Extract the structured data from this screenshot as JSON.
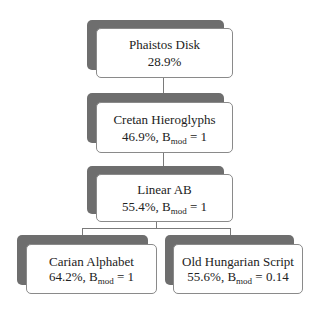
{
  "diagram": {
    "type": "tree",
    "nodes": [
      {
        "id": "phaistos",
        "name": "Phaistos Disk",
        "percent": "28.9%",
        "stat_line": "28.9%",
        "has_bmod": false
      },
      {
        "id": "cretan",
        "name": "Cretan Hieroglyphs",
        "percent": "46.9%",
        "bmod_label": "B",
        "bmod_sub": "mod",
        "bmod_value": "= 1",
        "has_bmod": true
      },
      {
        "id": "linear_ab",
        "name": "Linear AB",
        "percent": "55.4%",
        "bmod_label": "B",
        "bmod_sub": "mod",
        "bmod_value": "= 1",
        "has_bmod": true
      },
      {
        "id": "carian",
        "name": "Carian Alphabet",
        "percent": "64.2%",
        "bmod_label": "B",
        "bmod_sub": "mod",
        "bmod_value": "= 1",
        "has_bmod": true
      },
      {
        "id": "old_hungarian",
        "name": "Old Hungarian Script",
        "percent": "55.6%",
        "bmod_label": "B",
        "bmod_sub": "mod",
        "bmod_value": "= 0.14",
        "has_bmod": true
      }
    ],
    "edges": [
      {
        "from": "phaistos",
        "to": "cretan"
      },
      {
        "from": "cretan",
        "to": "linear_ab"
      },
      {
        "from": "linear_ab",
        "to": "carian"
      },
      {
        "from": "linear_ab",
        "to": "old_hungarian"
      }
    ],
    "colors": {
      "shadow": "#6e6e6e",
      "box_fill": "#ffffff",
      "border": "#8a8a8a",
      "connector": "#7a7a7a"
    }
  }
}
